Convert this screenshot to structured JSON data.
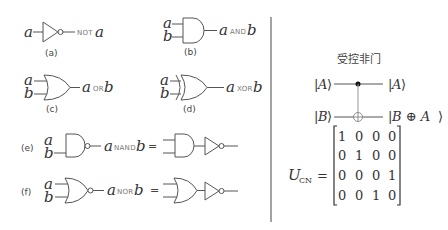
{
  "gates": {
    "not": {
      "input": "a",
      "output_var": "a",
      "op": "NOT",
      "caption": "(a)"
    },
    "and": {
      "input_a": "a",
      "input_b": "b",
      "out_a": "a",
      "op": "AND",
      "out_b": "b",
      "caption": "(b)"
    },
    "or": {
      "input_a": "a",
      "input_b": "b",
      "out_a": "a",
      "op": "OR",
      "out_b": "b",
      "caption": "(c)"
    },
    "xor": {
      "input_a": "a",
      "input_b": "b",
      "out_a": "a",
      "op": "XOR",
      "out_b": "b",
      "caption": "(d)"
    },
    "nand": {
      "label": "(e)",
      "input_a": "a",
      "input_b": "b",
      "out_a": "a",
      "op": "NAND",
      "out_b": "b",
      "equals": "="
    },
    "nor": {
      "label": "(f)",
      "input_a": "a",
      "input_b": "b",
      "out_a": "a",
      "op": "NOR",
      "out_b": "b",
      "equals": "="
    }
  },
  "cnot": {
    "title": "受控非门",
    "in_top_var": "A",
    "out_top_var": "A",
    "in_bot_var": "B",
    "out_bot_var": "B ⊕ A",
    "matrix_label": "U",
    "matrix_sub": "CN",
    "matrix_eq": "=",
    "matrix": [
      [
        "1",
        "0",
        "0",
        "0"
      ],
      [
        "0",
        "1",
        "0",
        "0"
      ],
      [
        "0",
        "0",
        "0",
        "1"
      ],
      [
        "0",
        "0",
        "1",
        "0"
      ]
    ]
  }
}
